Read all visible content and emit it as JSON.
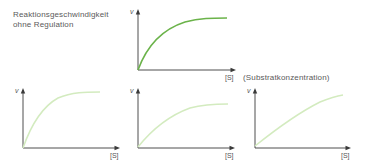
{
  "title": {
    "line1": "Reaktionsgeschwindigkeit",
    "line2": "ohne Regulation"
  },
  "axis_note": "(Substratkonzentration)",
  "colors": {
    "main_curve": "#6BB34A",
    "light_curve": "#D3EBBF",
    "axis": "#3A3A3A",
    "text": "#5A5A5A"
  },
  "panels": [
    {
      "id": "top",
      "y_label": "v",
      "x_label": "[S]",
      "origin": [
        138,
        70
      ],
      "x_end": 235,
      "y_top": 12,
      "curve_path": "M138,70 C146,48 160,30 185,22 C200,18 212,18 227,18",
      "curve_color": "#6BB34A"
    },
    {
      "id": "bottom-left",
      "y_label": "v",
      "x_label": "[S]",
      "origin": [
        23,
        148
      ],
      "x_end": 119,
      "y_top": 89,
      "curve_path": "M23,148 C30,128 40,108 58,98 C72,92 86,92 100,92",
      "curve_color": "#D3EBBF"
    },
    {
      "id": "bottom-middle",
      "y_label": "v",
      "x_label": "[S]",
      "origin": [
        138,
        148
      ],
      "x_end": 234,
      "y_top": 89,
      "curve_path": "M138,147 C150,132 168,116 190,108 C205,104 216,104 228,104",
      "curve_color": "#D3EBBF"
    },
    {
      "id": "bottom-right",
      "y_label": "v",
      "x_label": "[S]",
      "origin": [
        255,
        148
      ],
      "x_end": 350,
      "y_top": 89,
      "curve_path": "M255,146 C275,130 300,112 320,102 C330,98 337,96 343,95",
      "curve_color": "#D3EBBF"
    }
  ]
}
